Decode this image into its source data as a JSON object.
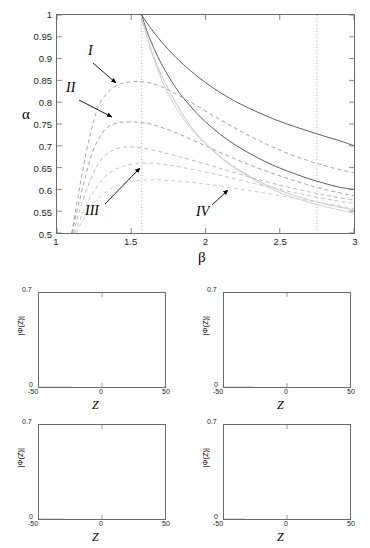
{
  "figure": {
    "main": {
      "xlabel": "β",
      "ylabel": "α",
      "xlim": [
        1,
        3
      ],
      "ylim": [
        0.5,
        1
      ],
      "xticks": [
        "1",
        "1.5",
        "2",
        "2.5",
        "3"
      ],
      "yticks": [
        "1",
        "0.95",
        "0.9",
        "0.85",
        "0.8",
        "0.75",
        "0.7",
        "0.65",
        "0.6",
        "0.55",
        "0.5"
      ],
      "annotations": [
        {
          "label": "I",
          "x": 1.22,
          "y": 0.905
        },
        {
          "label": "II",
          "x": 1.1,
          "y": 0.818
        },
        {
          "label": "III",
          "x": 1.33,
          "y": 0.568
        },
        {
          "label": "IV",
          "x": 1.9,
          "y": 0.558
        }
      ],
      "marker_lines": [
        1.57,
        2.75
      ]
    },
    "subplots": [
      {
        "tag": "I",
        "xlabel": "Z",
        "ylabel": "|Φ(Z)|",
        "xticks": [
          "-50",
          "0",
          "50"
        ],
        "yticks": [
          "0",
          "0.7"
        ],
        "xlim": [
          -50,
          50
        ],
        "ylim": [
          0,
          0.7
        ],
        "peaks": 2
      },
      {
        "tag": "II",
        "xlabel": "Z",
        "ylabel": "|Φ(Z)|",
        "xticks": [
          "-50",
          "0",
          "50"
        ],
        "yticks": [
          "0",
          "0.7"
        ],
        "xlim": [
          -50,
          50
        ],
        "ylim": [
          0,
          0.7
        ],
        "peaks": 3
      },
      {
        "tag": "III",
        "xlabel": "Z",
        "ylabel": "|Φ(Z)|",
        "xticks": [
          "-50",
          "0",
          "50"
        ],
        "yticks": [
          "0",
          "0.7"
        ],
        "xlim": [
          -50,
          50
        ],
        "ylim": [
          0,
          0.7
        ],
        "peaks": 4
      },
      {
        "tag": "IV",
        "xlabel": "Z",
        "ylabel": "|Φ(Z)|",
        "xticks": [
          "-50",
          "0",
          "50"
        ],
        "yticks": [
          "0",
          "0.7"
        ],
        "xlim": [
          -50,
          50
        ],
        "ylim": [
          0,
          0.7
        ],
        "peaks": 5
      }
    ]
  },
  "chart_data": {
    "type": "line",
    "title": "",
    "xlabel": "β",
    "ylabel": "α",
    "xlim": [
      1,
      3
    ],
    "ylim": [
      0.5,
      1
    ],
    "grid": false,
    "legend": "none",
    "vertical_marker_lines": [
      1.57,
      2.75
    ],
    "series": [
      {
        "name": "solid-upper",
        "style": "solid",
        "color": "#555555",
        "x": [
          1.57,
          1.62,
          1.7,
          1.8,
          1.9,
          2.0,
          2.1,
          2.2,
          2.3,
          2.4,
          2.5,
          2.6,
          2.7,
          2.8,
          2.9,
          3.0
        ],
        "y": [
          1.0,
          0.975,
          0.94,
          0.903,
          0.872,
          0.845,
          0.822,
          0.802,
          0.785,
          0.77,
          0.756,
          0.744,
          0.733,
          0.722,
          0.712,
          0.7
        ]
      },
      {
        "name": "solid-lower",
        "style": "solid",
        "color": "#555555",
        "x": [
          1.57,
          1.62,
          1.7,
          1.8,
          1.9,
          2.0,
          2.1,
          2.2,
          2.3,
          2.4,
          2.5,
          2.6,
          2.7,
          2.8,
          2.9,
          3.0
        ],
        "y": [
          1.0,
          0.95,
          0.89,
          0.833,
          0.79,
          0.755,
          0.726,
          0.702,
          0.682,
          0.664,
          0.649,
          0.636,
          0.624,
          0.614,
          0.605,
          0.6
        ]
      },
      {
        "name": "dashed-I",
        "style": "dashed",
        "color": "#9a9a9a",
        "x": [
          1.1,
          1.15,
          1.2,
          1.25,
          1.3,
          1.4,
          1.5,
          1.57,
          1.65,
          1.75,
          1.9,
          2.1,
          2.3,
          2.5,
          2.7,
          2.85,
          3.0
        ],
        "y": [
          0.5,
          0.6,
          0.69,
          0.76,
          0.805,
          0.838,
          0.847,
          0.847,
          0.842,
          0.828,
          0.8,
          0.76,
          0.722,
          0.69,
          0.665,
          0.65,
          0.638
        ]
      },
      {
        "name": "dashed-II",
        "style": "dashed",
        "color": "#9a9a9a",
        "x": [
          1.1,
          1.15,
          1.2,
          1.25,
          1.32,
          1.4,
          1.5,
          1.57,
          1.65,
          1.8,
          2.0,
          2.2,
          2.4,
          2.6,
          2.8,
          3.0
        ],
        "y": [
          0.5,
          0.572,
          0.64,
          0.695,
          0.736,
          0.752,
          0.755,
          0.753,
          0.748,
          0.73,
          0.7,
          0.67,
          0.643,
          0.62,
          0.6,
          0.585
        ]
      },
      {
        "name": "dashed-III",
        "style": "dashed",
        "color": "#b2b2b2",
        "x": [
          1.11,
          1.16,
          1.22,
          1.28,
          1.35,
          1.45,
          1.57,
          1.7,
          1.9,
          2.1,
          2.3,
          2.5,
          2.7,
          2.85,
          3.0
        ],
        "y": [
          0.5,
          0.56,
          0.618,
          0.66,
          0.685,
          0.697,
          0.695,
          0.686,
          0.668,
          0.648,
          0.628,
          0.61,
          0.594,
          0.584,
          0.575
        ]
      },
      {
        "name": "dashed-IV",
        "style": "dashed",
        "color": "#bebebe",
        "x": [
          1.12,
          1.18,
          1.25,
          1.32,
          1.42,
          1.55,
          1.7,
          1.85,
          2.05,
          2.25,
          2.45,
          2.65,
          2.85,
          3.0
        ],
        "y": [
          0.5,
          0.55,
          0.596,
          0.628,
          0.65,
          0.66,
          0.658,
          0.65,
          0.636,
          0.62,
          0.604,
          0.589,
          0.576,
          0.568
        ]
      },
      {
        "name": "dashed-V",
        "style": "dashed",
        "color": "#c8c8c8",
        "x": [
          1.13,
          1.2,
          1.28,
          1.38,
          1.5,
          1.65,
          1.85,
          2.05,
          2.3,
          2.55,
          2.8,
          3.0
        ],
        "y": [
          0.5,
          0.545,
          0.58,
          0.605,
          0.618,
          0.622,
          0.618,
          0.61,
          0.597,
          0.583,
          0.568,
          0.556
        ]
      },
      {
        "name": "light-branch-upper",
        "style": "solid",
        "color": "#c4c4c4",
        "x": [
          1.57,
          1.65,
          1.75,
          1.9,
          2.05,
          2.2,
          2.4,
          2.6,
          2.8,
          3.0
        ],
        "y": [
          0.99,
          0.905,
          0.83,
          0.745,
          0.69,
          0.65,
          0.612,
          0.586,
          0.567,
          0.553
        ]
      },
      {
        "name": "light-branch-lower",
        "style": "solid",
        "color": "#cfcfcf",
        "x": [
          1.62,
          1.72,
          1.85,
          2.0,
          2.2,
          2.45,
          2.7,
          3.0
        ],
        "y": [
          0.93,
          0.84,
          0.762,
          0.704,
          0.648,
          0.6,
          0.57,
          0.545
        ]
      }
    ],
    "subplot_profiles": [
      {
        "tag": "I",
        "peaks": 2,
        "xlim": [
          -50,
          50
        ],
        "ylim": [
          0,
          0.7
        ],
        "xlabel": "Z",
        "ylabel": "|Φ(Z)|"
      },
      {
        "tag": "II",
        "peaks": 3,
        "xlim": [
          -50,
          50
        ],
        "ylim": [
          0,
          0.7
        ],
        "xlabel": "Z",
        "ylabel": "|Φ(Z)|"
      },
      {
        "tag": "III",
        "peaks": 4,
        "xlim": [
          -50,
          50
        ],
        "ylim": [
          0,
          0.7
        ],
        "xlabel": "Z",
        "ylabel": "|Φ(Z)|"
      },
      {
        "tag": "IV",
        "peaks": 5,
        "xlim": [
          -50,
          50
        ],
        "ylim": [
          0,
          0.7
        ],
        "xlabel": "Z",
        "ylabel": "|Φ(Z)|"
      }
    ]
  }
}
